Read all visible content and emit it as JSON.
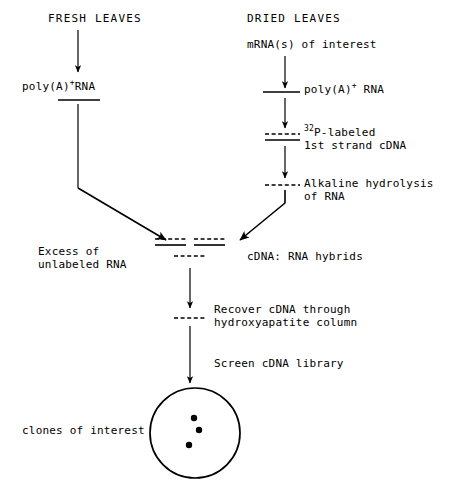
{
  "diagram": {
    "title_left": "FRESH LEAVES",
    "title_right": "DRIED LEAVES",
    "nodes": {
      "mrna_interest": "mRNA(s) of interest",
      "poly_a_left_pre": "poly(A)",
      "poly_a_left_sup": "+",
      "poly_a_left_post": "RNA",
      "poly_a_right_pre": "poly(A)",
      "poly_a_right_sup": "+",
      "poly_a_right_post": " RNA",
      "p_labeled_sup": "32",
      "p_labeled_line1": "P-labeled",
      "p_labeled_line2": "1st strand cDNA",
      "alkaline_line1": "Alkaline hydrolysis",
      "alkaline_line2": "of RNA",
      "excess_line1": "Excess of",
      "excess_line2": "unlabeled RNA",
      "hybrids": "cDNA: RNA hybrids",
      "recover_line1": "Recover cDNA through",
      "recover_line2": "hydroxyapatite column",
      "screen": "Screen cDNA library",
      "clones": "clones of interest"
    },
    "colors": {
      "stroke": "#000000",
      "background": "#ffffff"
    }
  }
}
